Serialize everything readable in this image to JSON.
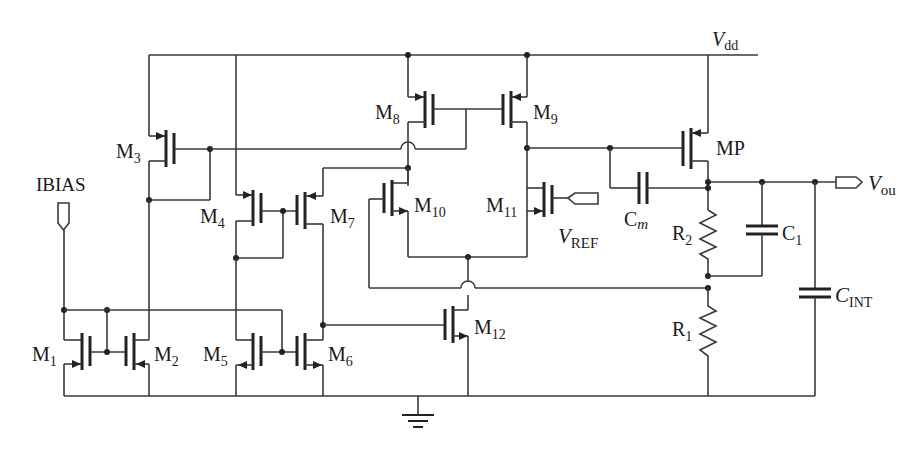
{
  "diagram": {
    "type": "circuit-schematic",
    "supply_label": "V",
    "supply_sub": "dd",
    "ibias_label": "IBIAS",
    "vref_label": "V",
    "vref_sub": "REF",
    "vout_label": "V",
    "vout_sub": "ou",
    "transistors": [
      {
        "id": "M1",
        "name": "M",
        "sub": "1",
        "type": "nmos"
      },
      {
        "id": "M2",
        "name": "M",
        "sub": "2",
        "type": "nmos"
      },
      {
        "id": "M3",
        "name": "M",
        "sub": "3",
        "type": "pmos"
      },
      {
        "id": "M4",
        "name": "M",
        "sub": "4",
        "type": "pmos"
      },
      {
        "id": "M5",
        "name": "M",
        "sub": "5",
        "type": "nmos"
      },
      {
        "id": "M6",
        "name": "M",
        "sub": "6",
        "type": "nmos"
      },
      {
        "id": "M7",
        "name": "M",
        "sub": "7",
        "type": "pmos"
      },
      {
        "id": "M8",
        "name": "M",
        "sub": "8",
        "type": "pmos"
      },
      {
        "id": "M9",
        "name": "M",
        "sub": "9",
        "type": "pmos"
      },
      {
        "id": "M10",
        "name": "M",
        "sub": "10",
        "type": "nmos"
      },
      {
        "id": "M11",
        "name": "M",
        "sub": "11",
        "type": "nmos"
      },
      {
        "id": "M12",
        "name": "M",
        "sub": "12",
        "type": "nmos"
      },
      {
        "id": "MP",
        "name": "MP",
        "sub": "",
        "type": "pmos"
      }
    ],
    "passives": [
      {
        "id": "Cm",
        "name": "C",
        "sub": "m",
        "kind": "capacitor"
      },
      {
        "id": "C1",
        "name": "C",
        "sub": "1",
        "kind": "capacitor"
      },
      {
        "id": "CINT",
        "name": "C",
        "sub": "INT",
        "kind": "capacitor"
      },
      {
        "id": "R1",
        "name": "R",
        "sub": "1",
        "kind": "resistor"
      },
      {
        "id": "R2",
        "name": "R",
        "sub": "2",
        "kind": "resistor"
      }
    ],
    "ground_symbol": "ground-icon"
  }
}
